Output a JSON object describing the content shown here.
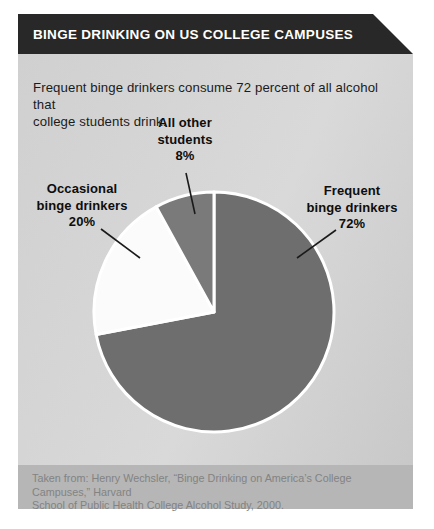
{
  "header": {
    "title": "BINGE DRINKING ON US COLLEGE CAMPUSES",
    "bg_color": "#282828",
    "text_color": "#ffffff"
  },
  "intro": {
    "lines": [
      "Frequent binge drinkers consume 72 percent of all alcohol that",
      "college students drink."
    ]
  },
  "chart_data": {
    "type": "pie",
    "title": "Binge drinking on US college campuses",
    "direction": "clockwise",
    "start_angle_deg": 0,
    "legend": "none",
    "separator_color": "#ffffff",
    "slices": [
      {
        "name": "Frequent binge drinkers",
        "value": 72,
        "pct_label": "72%",
        "label_lines": [
          "Frequent",
          "binge drinkers"
        ],
        "color": "#6e6e6e"
      },
      {
        "name": "Occasional binge drinkers",
        "value": 20,
        "pct_label": "20%",
        "label_lines": [
          "Occasional",
          "binge drinkers"
        ],
        "color": "#fbfbfb"
      },
      {
        "name": "All other students",
        "value": 8,
        "pct_label": "8%",
        "label_lines": [
          "All other",
          "students"
        ],
        "color": "#7a7a7a"
      }
    ]
  },
  "source": {
    "lines": [
      "Taken from: Henry Wechsler, “Binge Drinking on America’s College Campuses,” Harvard",
      "School of Public Health College Alcohol Study, 2000."
    ]
  }
}
